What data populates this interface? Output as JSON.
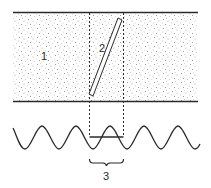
{
  "diagram": {
    "labels": {
      "medium": "1",
      "rod": "2",
      "wavelength": "3"
    },
    "colors": {
      "line": "#2a2a2a",
      "stipple": "#8a8a8a",
      "background": "#ffffff"
    }
  }
}
